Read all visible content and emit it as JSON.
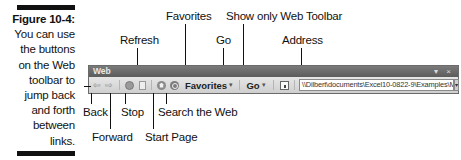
{
  "caption": {
    "figure_label": "Figure 10-4:",
    "text_lines": [
      "You can use",
      "the buttons",
      "on the Web",
      "toolbar to",
      "jump back",
      "and forth",
      "between",
      "links."
    ]
  },
  "callouts": {
    "favorites": "Favorites",
    "show_only_web_toolbar": "Show only Web Toolbar",
    "refresh": "Refresh",
    "go": "Go",
    "address": "Address",
    "back": "Back",
    "forward": "Forward",
    "stop": "Stop",
    "start_page": "Start Page",
    "search_the_web": "Search the Web"
  },
  "toolbar": {
    "title": "Web",
    "window_controls": "▾ ×",
    "buttons": {
      "back_icon": "⇦",
      "forward_icon": "⇨",
      "favorites_label": "Favorites",
      "favorites_caret": "▾",
      "go_label": "Go",
      "go_caret": "▾"
    },
    "address_value": "\\\\Dilbert\\documents\\Excel10-0822-9\\Examples\\MGE - 2001 Projects",
    "address_dropdown": "▾"
  }
}
